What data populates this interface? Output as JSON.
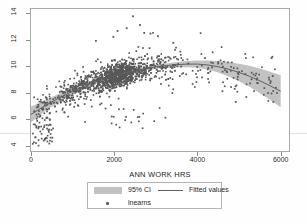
{
  "figure": {
    "background": "#ffffff",
    "frame_color": "#a9a9a9"
  },
  "axes": {
    "x": {
      "title": "ANN WORK HRS",
      "ticks": [
        "0",
        "2000",
        "4000",
        "6000"
      ],
      "tick_values": [
        0,
        2000,
        4000,
        6000
      ],
      "min": 0,
      "max": 6200
    },
    "y": {
      "title": "",
      "ticks": [
        "4",
        "6",
        "8",
        "10",
        "12",
        "14"
      ],
      "tick_values": [
        4,
        6,
        8,
        10,
        12,
        14
      ],
      "min": 3.6,
      "max": 14.3
    }
  },
  "legend": {
    "items": [
      {
        "label": "95% CI",
        "marker": "band-swatch",
        "color": "#c2c2c2"
      },
      {
        "label": "Fitted values",
        "marker": "line",
        "color": "#606060"
      },
      {
        "label": "lnearns",
        "marker": "point",
        "color": "#585858"
      }
    ]
  },
  "chart_data": {
    "type": "scatter",
    "title": "",
    "subtitle": "",
    "xlabel": "ANN WORK HRS",
    "ylabel": "lnearns",
    "xlim": [
      0,
      6200
    ],
    "ylim": [
      3.6,
      14.3
    ],
    "xticks": [
      0,
      2000,
      4000,
      6000
    ],
    "yticks": [
      4,
      6,
      8,
      10,
      12,
      14
    ],
    "grid": false,
    "legend_position": "below-axes",
    "series": [
      {
        "name": "Fitted values",
        "type": "line",
        "color": "#606060",
        "description": "Concave quadratic fit of log earnings on annual work hours; rises steeply from about 6.3 at 0 hours, peaks near 10.2 around 3600-4000 hours, then declines to about 8.1 at 6000 hours.",
        "x": [
          0,
          250,
          500,
          750,
          1000,
          1250,
          1500,
          1750,
          2000,
          2250,
          2500,
          2750,
          3000,
          3250,
          3500,
          3750,
          4000,
          4250,
          4500,
          4750,
          5000,
          5250,
          5500,
          5750,
          6000
        ],
        "y": [
          6.35,
          6.85,
          7.3,
          7.72,
          8.1,
          8.44,
          8.75,
          9.02,
          9.27,
          9.48,
          9.66,
          9.81,
          9.94,
          10.04,
          10.11,
          10.15,
          10.15,
          10.08,
          9.95,
          9.76,
          9.52,
          9.23,
          8.89,
          8.51,
          8.1
        ]
      },
      {
        "name": "95% CI upper",
        "type": "line",
        "color": "#c2c2c2",
        "x": [
          0,
          250,
          500,
          750,
          1000,
          1250,
          1500,
          1750,
          2000,
          2250,
          2500,
          2750,
          3000,
          3250,
          3500,
          3750,
          4000,
          4250,
          4500,
          4750,
          5000,
          5250,
          5500,
          5750,
          6000
        ],
        "y": [
          6.95,
          7.3,
          7.67,
          8.02,
          8.35,
          8.65,
          8.92,
          9.17,
          9.4,
          9.6,
          9.78,
          9.94,
          10.08,
          10.2,
          10.3,
          10.38,
          10.42,
          10.42,
          10.38,
          10.3,
          10.18,
          10.02,
          9.82,
          9.58,
          9.3
        ]
      },
      {
        "name": "95% CI lower",
        "type": "line",
        "color": "#c2c2c2",
        "x": [
          0,
          250,
          500,
          750,
          1000,
          1250,
          1500,
          1750,
          2000,
          2250,
          2500,
          2750,
          3000,
          3250,
          3500,
          3750,
          4000,
          4250,
          4500,
          4750,
          5000,
          5250,
          5500,
          5750,
          6000
        ],
        "y": [
          5.75,
          6.4,
          6.93,
          7.42,
          7.85,
          8.23,
          8.58,
          8.87,
          9.14,
          9.36,
          9.54,
          9.68,
          9.8,
          9.88,
          9.92,
          9.92,
          9.88,
          9.74,
          9.52,
          9.22,
          8.86,
          8.44,
          7.96,
          7.44,
          6.9
        ]
      },
      {
        "name": "lnearns",
        "type": "scatter",
        "color": "#585858",
        "marker": "square",
        "n_points": 1400,
        "description": "Dense cloud of log-earnings observations concentrated between 1500 and 3000 annual hours with values mostly between 8.5 and 11.5; sparse scatter below 6 near the origin and a thin tail of points out to 6000 hours."
      }
    ]
  }
}
